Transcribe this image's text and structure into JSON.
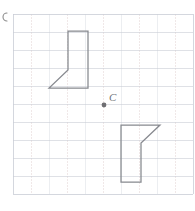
{
  "canvas": {
    "width": 195,
    "height": 211,
    "background_color": "#ffffff"
  },
  "grid": {
    "name": "coordinate-grid",
    "left": 13,
    "top": 14,
    "cell_size": 18,
    "columns": 10,
    "rows": 10,
    "line_color": "#c9cdd6",
    "minor_line_color": "#dfe2e8",
    "dashed_accent_color": "#e6d9d9"
  },
  "corner_mark": {
    "name": "page-corner-mark",
    "color": "#8a8a8a",
    "cx": 3,
    "cy": 17,
    "r": 4
  },
  "center_point": {
    "label": "C",
    "label_color": "#6f7379",
    "dot_color": "#6f6f73",
    "dot_x": 104,
    "dot_y": 105,
    "dot_r": 2.4,
    "label_x": 109,
    "label_y": 101
  },
  "shapes": [
    {
      "name": "preimage-polygon",
      "label": "upper flag polygon",
      "stroke_color": "#87898f",
      "fill": "none",
      "points": "68,31 88,31 88,88 49,88 68,70"
    },
    {
      "name": "image-polygon",
      "label": "lower rotated flag polygon",
      "stroke_color": "#87898f",
      "fill": "none",
      "points": "141,182 121,182 121,125 160,125 141,143"
    }
  ],
  "chart_data": {
    "type": "scatter",
    "title": "",
    "xlabel": "",
    "ylabel": "",
    "grid": true,
    "legend": "none",
    "xlim": [
      0,
      10
    ],
    "ylim": [
      0,
      10
    ],
    "annotations": [
      {
        "text": "C",
        "x": 5.05,
        "y": 4.95
      }
    ],
    "series": [
      {
        "name": "Preimage polygon vertices (grid units)",
        "x": [
          3.06,
          4.17,
          4.17,
          2.0,
          3.06
        ],
        "y": [
          9.06,
          9.06,
          5.89,
          5.89,
          6.89
        ]
      },
      {
        "name": "Image polygon vertices (grid units)",
        "x": [
          7.11,
          6.0,
          6.0,
          8.17,
          7.11
        ],
        "y": [
          1.06,
          1.06,
          4.22,
          4.22,
          3.22
        ]
      }
    ]
  }
}
